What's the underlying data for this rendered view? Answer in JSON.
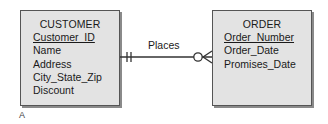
{
  "diagram": {
    "entities": [
      {
        "name": "CUSTOMER",
        "attributes": [
          {
            "label": "Customer_ID",
            "primary_key": true
          },
          {
            "label": "Name",
            "primary_key": false
          },
          {
            "label": "Address",
            "primary_key": false
          },
          {
            "label": "City_State_Zip",
            "primary_key": false
          },
          {
            "label": "Discount",
            "primary_key": false
          }
        ]
      },
      {
        "name": "ORDER",
        "attributes": [
          {
            "label": "Order_Number",
            "primary_key": true
          },
          {
            "label": "Order_Date",
            "primary_key": false
          },
          {
            "label": "Promises_Date",
            "primary_key": false
          }
        ]
      }
    ],
    "relationship": {
      "label": "Places",
      "from": "CUSTOMER",
      "to": "ORDER",
      "from_cardinality": "mandatory-one",
      "to_cardinality": "optional-many"
    },
    "caption": "A"
  },
  "colors": {
    "entity_fill": "#e3e3e3",
    "entity_border": "#555555",
    "line": "#333333"
  }
}
